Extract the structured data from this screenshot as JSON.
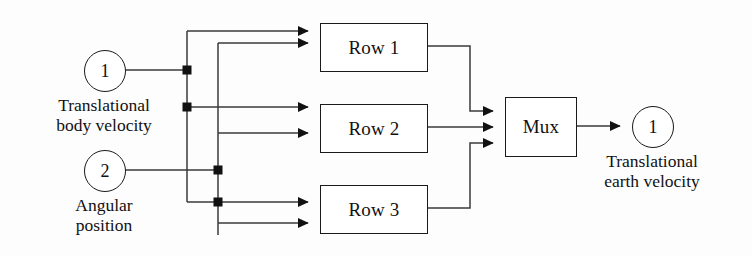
{
  "diagram": {
    "type": "block-diagram",
    "style": "simulink",
    "background_color": "#fdfdfd",
    "line_color": "#1a1a1a",
    "inputs": [
      {
        "id": "in1",
        "port_number": "1",
        "caption": "Translational\nbody velocity",
        "cx": 104,
        "cy": 70,
        "r": 20
      },
      {
        "id": "in2",
        "port_number": "2",
        "caption": "Angular\nposition",
        "cx": 104,
        "cy": 170,
        "r": 20
      }
    ],
    "blocks": [
      {
        "id": "row1",
        "label": "Row 1",
        "x": 320,
        "y": 23,
        "w": 106,
        "h": 47
      },
      {
        "id": "row2",
        "label": "Row 2",
        "x": 320,
        "y": 104,
        "w": 106,
        "h": 47
      },
      {
        "id": "row3",
        "label": "Row 3",
        "x": 320,
        "y": 185,
        "w": 106,
        "h": 47
      },
      {
        "id": "mux",
        "label": "Mux",
        "x": 505,
        "y": 97,
        "w": 70,
        "h": 58
      }
    ],
    "outputs": [
      {
        "id": "out1",
        "port_number": "1",
        "caption": "Translational\nearth velocity",
        "cx": 652,
        "cy": 126,
        "r": 20
      }
    ],
    "junctions": [
      {
        "id": "j1",
        "x": 187,
        "y": 70
      },
      {
        "id": "j2",
        "x": 187,
        "y": 107
      },
      {
        "id": "j3",
        "x": 218,
        "y": 170
      },
      {
        "id": "j4",
        "x": 218,
        "y": 202
      }
    ],
    "connections": [
      {
        "from": "in1",
        "to": "bus-a",
        "label": "translational body velocity bus"
      },
      {
        "from": "in2",
        "to": "bus-b",
        "label": "angular position bus"
      },
      {
        "from": "bus-a",
        "to": "row1",
        "label": "row1 input 1"
      },
      {
        "from": "bus-b",
        "to": "row1",
        "label": "row1 input 2"
      },
      {
        "from": "bus-a",
        "to": "row2",
        "label": "row2 input 1"
      },
      {
        "from": "bus-b",
        "to": "row2",
        "label": "row2 input 2"
      },
      {
        "from": "bus-a",
        "to": "row3",
        "label": "row3 input 1"
      },
      {
        "from": "bus-b",
        "to": "row3",
        "label": "row3 input 2"
      },
      {
        "from": "row1",
        "to": "mux",
        "label": "mux input 1"
      },
      {
        "from": "row2",
        "to": "mux",
        "label": "mux input 2"
      },
      {
        "from": "row3",
        "to": "mux",
        "label": "mux input 3"
      },
      {
        "from": "mux",
        "to": "out1",
        "label": "output signal"
      }
    ]
  }
}
